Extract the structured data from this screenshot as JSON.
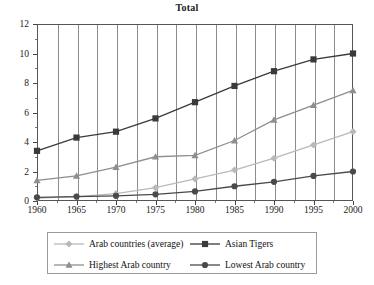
{
  "chart_data": {
    "type": "line",
    "title": "Total",
    "xlabel": "",
    "ylabel": "",
    "x": [
      1960,
      1965,
      1970,
      1975,
      1980,
      1985,
      1990,
      1995,
      2000
    ],
    "categories": [
      "1960",
      "1965",
      "1970",
      "1975",
      "1980",
      "1985",
      "1990",
      "1995",
      "2000"
    ],
    "xlim": [
      1960,
      2000
    ],
    "ylim": [
      0,
      12
    ],
    "ytick_labels": [
      "0",
      "2",
      "4",
      "6",
      "8",
      "10",
      "12"
    ],
    "ytick_values": [
      0,
      2,
      4,
      6,
      8,
      10,
      12
    ],
    "xtick_labels": [
      "1960",
      "1965",
      "1970",
      "1975",
      "1980",
      "1985",
      "1990",
      "1995",
      "2000"
    ],
    "grid": "vertical",
    "legend_position": "bottom",
    "series": [
      {
        "name": "Arab countries (average)",
        "marker": "diamond",
        "color": "#b9b9b9",
        "values": [
          0.2,
          0.3,
          0.5,
          0.9,
          1.5,
          2.1,
          2.9,
          3.8,
          4.7
        ]
      },
      {
        "name": "Asian Tigers",
        "marker": "square",
        "color": "#3a3a3a",
        "values": [
          3.4,
          4.3,
          4.7,
          5.6,
          6.7,
          7.8,
          8.8,
          9.6,
          10.0
        ]
      },
      {
        "name": "Highest Arab country",
        "marker": "triangle",
        "color": "#8e8e8e",
        "values": [
          1.4,
          1.7,
          2.3,
          3.0,
          3.1,
          4.1,
          5.5,
          6.5,
          7.5
        ]
      },
      {
        "name": "Lowest Arab country",
        "marker": "circle",
        "color": "#4a4a4a",
        "values": [
          0.25,
          0.3,
          0.35,
          0.45,
          0.65,
          1.0,
          1.3,
          1.7,
          2.0
        ]
      }
    ]
  },
  "legend": {
    "entries": [
      {
        "label": "Arab countries (average)",
        "marker": "diamond-marker-icon"
      },
      {
        "label": "Asian Tigers",
        "marker": "square-marker-icon"
      },
      {
        "label": "Highest Arab country",
        "marker": "triangle-marker-icon"
      },
      {
        "label": "Lowest Arab country",
        "marker": "circle-marker-icon"
      }
    ]
  }
}
